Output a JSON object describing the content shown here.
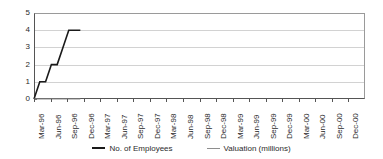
{
  "chart_data": {
    "type": "line",
    "title": "",
    "xlabel": "",
    "ylabel": "",
    "ylim": [
      0,
      5
    ],
    "yticks": [
      0,
      1,
      2,
      3,
      4,
      5
    ],
    "grid": true,
    "legend_position": "bottom",
    "categories": [
      "Mar-96",
      "Jun-96",
      "Sep-96",
      "Dec-96",
      "Mar-97",
      "Jun-97",
      "Sep-97",
      "Dec-97",
      "Mar-98",
      "Jun-98",
      "Sep-98",
      "Dec-98",
      "Mar-99",
      "Jun-99",
      "Sep-99",
      "Dec-99",
      "Mar-00",
      "Jun-00",
      "Sep-00",
      "Dec-00"
    ],
    "series": [
      {
        "name": "No. of Employees",
        "color": "#1a1a1a",
        "x": [
          0.0,
          0.35,
          0.7,
          1.05,
          1.4,
          1.75,
          2.1,
          2.45,
          2.8
        ],
        "values": [
          0,
          1,
          1,
          2,
          2,
          3,
          4,
          4,
          4
        ]
      },
      {
        "name": "Valuation (millions)",
        "color": "#8e8e8e",
        "x": [
          0.0,
          0.35,
          0.7,
          1.05,
          1.4,
          1.75,
          2.1,
          2.45,
          2.8
        ],
        "values": [
          0,
          0,
          0,
          0,
          0,
          0,
          0,
          0,
          0
        ]
      }
    ]
  },
  "legend": {
    "entries": [
      {
        "label": "No. of Employees",
        "color": "#1a1a1a",
        "weight": "thick"
      },
      {
        "label": "Valuation (millions)",
        "color": "#8e8e8e",
        "weight": "thin"
      }
    ]
  }
}
